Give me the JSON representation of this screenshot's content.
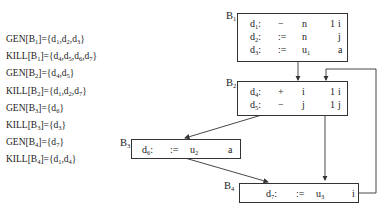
{
  "sets": [
    {
      "kind": "GEN",
      "block": "1",
      "elems": [
        "1",
        "2",
        "3"
      ]
    },
    {
      "kind": "KILL",
      "block": "1",
      "elems": [
        "4",
        "5",
        "6",
        "7"
      ]
    },
    {
      "kind": "GEN",
      "block": "2",
      "elems": [
        "4",
        "5"
      ]
    },
    {
      "kind": "KILL",
      "block": "2",
      "elems": [
        "1",
        "2",
        "7"
      ]
    },
    {
      "kind": "GEN",
      "block": "3",
      "elems": [
        "6"
      ]
    },
    {
      "kind": "KILL",
      "block": "3",
      "elems": [
        "3"
      ]
    },
    {
      "kind": "GEN",
      "block": "4",
      "elems": [
        "7"
      ]
    },
    {
      "kind": "KILL",
      "block": "4",
      "elems": [
        "1",
        "4"
      ]
    }
  ],
  "blocks": [
    {
      "id": "1",
      "rows": [
        {
          "d": "1",
          "op": "−",
          "a": "n",
          "b": "1",
          "r": "i"
        },
        {
          "d": "2",
          "op": ":=",
          "a": "n",
          "b": "",
          "r": "j"
        },
        {
          "d": "3",
          "op": ":=",
          "a": "u",
          "asub": "1",
          "b": "",
          "r": "a"
        }
      ]
    },
    {
      "id": "2",
      "rows": [
        {
          "d": "4",
          "op": "+",
          "a": "i",
          "b": "1",
          "r": "i"
        },
        {
          "d": "5",
          "op": "−",
          "a": "j",
          "b": "1",
          "r": "j"
        }
      ]
    },
    {
      "id": "3",
      "rows": [
        {
          "d": "6",
          "op": ":=",
          "a": "u",
          "asub": "2",
          "b": "",
          "r": "a"
        }
      ]
    },
    {
      "id": "4",
      "rows": [
        {
          "d": "7",
          "op": ":=",
          "a": "u",
          "asub": "3",
          "b": "",
          "r": "i"
        }
      ]
    }
  ]
}
